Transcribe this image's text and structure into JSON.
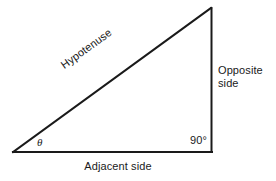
{
  "diagram": {
    "background_color": "#ffffff",
    "stroke_color": "#1a1a1a",
    "stroke_width": 2,
    "vertices": {
      "left_angle": [
        13,
        152
      ],
      "right_angle": [
        212,
        152
      ],
      "apex": [
        211,
        8
      ]
    },
    "labels": {
      "hypotenuse": "Hypotenuse",
      "opposite_line1": "Opposite",
      "opposite_line2": "side",
      "adjacent": "Adjacent side",
      "right_angle": "90°",
      "theta": "θ"
    }
  }
}
